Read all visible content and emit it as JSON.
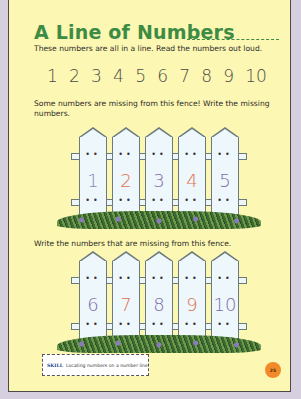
{
  "title": "A Line of Numbers",
  "intro_text": "These numbers are all in a line. Read the numbers out loud.",
  "number_line": [
    "1",
    "2",
    "3",
    "4",
    "5",
    "6",
    "7",
    "8",
    "9",
    "10"
  ],
  "fence1": {
    "instruction": "Some numbers are missing from this fence! Write the missing numbers.",
    "pickets": [
      {
        "label": "1",
        "color": "#8a86b8"
      },
      {
        "label": "2",
        "color": "#e0704a"
      },
      {
        "label": "3",
        "color": "#7c6aa8"
      },
      {
        "label": "4",
        "color": "#e0704a"
      },
      {
        "label": "5",
        "color": "#7c6aa8"
      }
    ]
  },
  "fence2": {
    "instruction": "Write the numbers that are missing from this fence.",
    "pickets": [
      {
        "label": "6",
        "color": "#7c6aa8"
      },
      {
        "label": "7",
        "color": "#e0704a"
      },
      {
        "label": "8",
        "color": "#7c6aa8"
      },
      {
        "label": "9",
        "color": "#e0704a"
      },
      {
        "label": "10",
        "color": "#7c6aa8"
      }
    ]
  },
  "skill": {
    "label": "SKILL",
    "text": "Locating numbers on a number line"
  },
  "page_number": "25",
  "colors": {
    "title": "#3d8b45",
    "page_bg": "#fcf7b2",
    "outer_bg": "#d6cfe0",
    "page_badge": "#f08a2a"
  }
}
